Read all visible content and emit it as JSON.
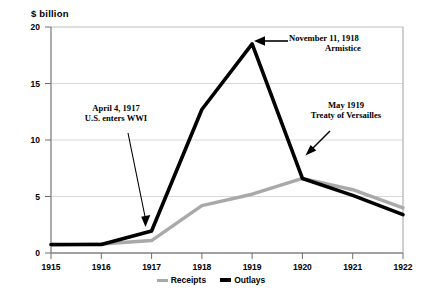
{
  "chart_data": {
    "type": "line",
    "title": "",
    "subtitle": "",
    "xlabel": "",
    "ylabel": "$  billion",
    "x": [
      1915,
      1916,
      1917,
      1918,
      1919,
      1920,
      1921,
      1922
    ],
    "xtick_labels": [
      "1915",
      "1916",
      "1917",
      "1918",
      "1919",
      "1920",
      "1921",
      "1922"
    ],
    "ytick_labels": [
      "0",
      "5",
      "10",
      "15",
      "20"
    ],
    "yticks": [
      0,
      5,
      10,
      15,
      20
    ],
    "ylim": [
      0,
      20
    ],
    "xlim": [
      1915,
      1922
    ],
    "grid": true,
    "legend_position": "bottom",
    "series": [
      {
        "name": "Receipts",
        "color": "#a9a9a9",
        "values": [
          0.7,
          0.8,
          1.1,
          4.2,
          5.2,
          6.6,
          5.6,
          4.0
        ]
      },
      {
        "name": "Outlays",
        "color": "#000000",
        "values": [
          0.75,
          0.75,
          1.95,
          12.7,
          18.5,
          6.6,
          5.1,
          3.4
        ]
      }
    ],
    "annotations": [
      {
        "id": "us-enters-wwi",
        "line1": "April 4, 1917",
        "line2": "U.S. enters WWI",
        "target_x": 1917,
        "target_y": 1.95
      },
      {
        "id": "armistice",
        "line1": "November 11, 1918",
        "line2": "Armistice",
        "target_x": 1919,
        "target_y": 18.5
      },
      {
        "id": "treaty-of-versailles",
        "line1": "May 1919",
        "line2": "Treaty of Versailles",
        "target_x": 1920,
        "target_y": 6.6
      }
    ]
  },
  "legend": {
    "items": [
      {
        "label": "Receipts",
        "color": "#a9a9a9"
      },
      {
        "label": "Outlays",
        "color": "#000000"
      }
    ]
  }
}
